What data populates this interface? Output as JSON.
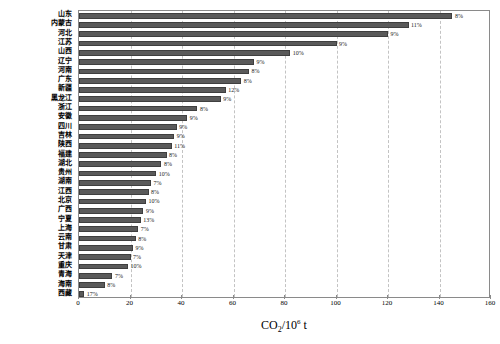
{
  "figure": {
    "top_note": "",
    "bar_color": "#5a5a5a",
    "grid_color": "#c3c3c3",
    "frame_color": "#8a8a8a"
  },
  "axis": {
    "x_title_main": "CO",
    "x_title_sub": "2",
    "x_title_slash": "/10",
    "x_title_sup": "6",
    "x_title_unit": " t",
    "x_ticks": [
      "0",
      "20",
      "40",
      "60",
      "80",
      "100",
      "120",
      "140",
      "160"
    ],
    "x_min": 0,
    "x_max": 160
  },
  "chart_data": {
    "type": "bar",
    "orientation": "horizontal",
    "title": "",
    "xlabel": "CO2/10^6 t",
    "ylabel": "",
    "xlim": [
      0,
      160
    ],
    "grid": "vertical-dashed",
    "legend": "none",
    "categories": [
      "山东",
      "内蒙古",
      "河北",
      "江苏",
      "山西",
      "辽宁",
      "河南",
      "广东",
      "新疆",
      "黑龙江",
      "浙江",
      "安徽",
      "四川",
      "吉林",
      "陕西",
      "福建",
      "湖北",
      "贵州",
      "湖南",
      "江西",
      "北京",
      "广西",
      "宁夏",
      "上海",
      "云南",
      "甘肃",
      "天津",
      "重庆",
      "青海",
      "海南",
      "西藏"
    ],
    "values": [
      145,
      128,
      120,
      100,
      82,
      68,
      66,
      63,
      57,
      55,
      46,
      42,
      38,
      37,
      36,
      34,
      32,
      30,
      28,
      27,
      26,
      25,
      24,
      23,
      22,
      21,
      20,
      19,
      13,
      10,
      2
    ],
    "data_labels": [
      "8%",
      "11%",
      "9%",
      "9%",
      "10%",
      "9%",
      "8%",
      "8%",
      "12%",
      "9%",
      "8%",
      "9%",
      "9%",
      "9%",
      "11%",
      "8%",
      "8%",
      "10%",
      "7%",
      "8%",
      "10%",
      "9%",
      "13%",
      "7%",
      "8%",
      "9%",
      "7%",
      "10%",
      "7%",
      "8%",
      "17%"
    ],
    "value_unit": "10^6 t CO2",
    "label_unit": "percent"
  }
}
